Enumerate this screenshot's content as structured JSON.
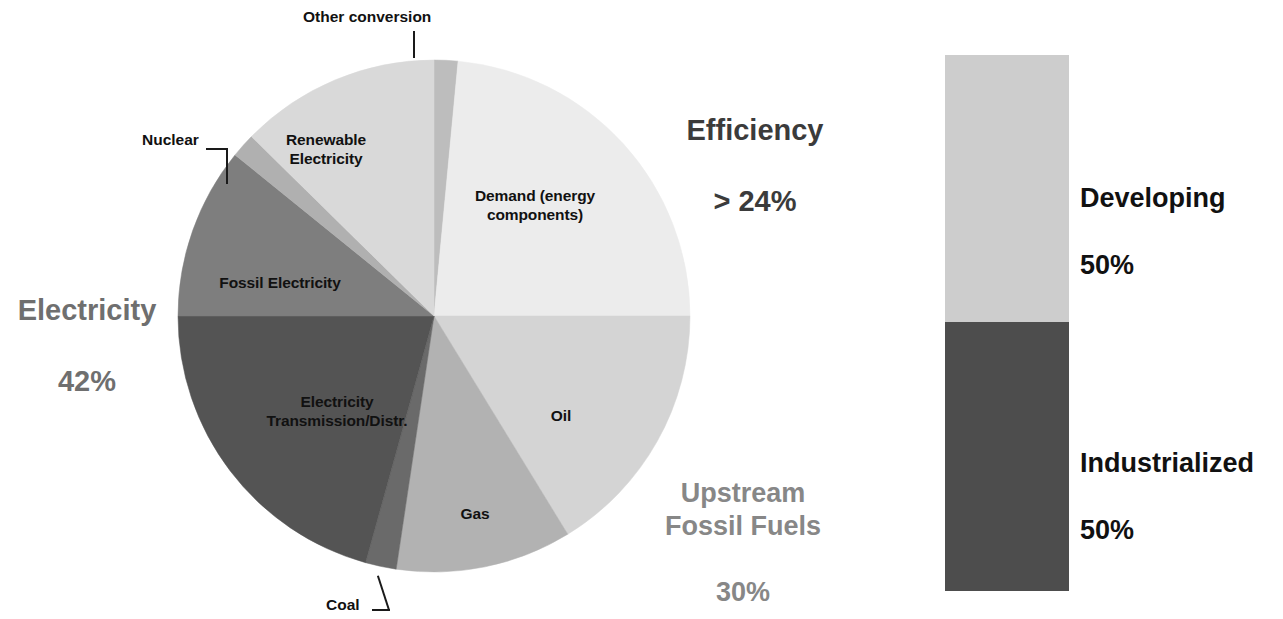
{
  "figure": {
    "background_color": "#ffffff"
  },
  "chart_data": [
    {
      "type": "pie",
      "title": "",
      "name": "global-energy-system-losses-pie",
      "total_note": "slices ordered clockwise starting at 12 o'clock",
      "categories": [
        "Other conversion",
        "Demand (energy components)",
        "Oil",
        "Gas",
        "Coal",
        "Electricity Transmission/Distr.",
        "Fossil Electricity",
        "Nuclear",
        "Renewable Electricity"
      ],
      "values": [
        1.5,
        24,
        16,
        11,
        2,
        21,
        11,
        1.5,
        12
      ],
      "unit": "%",
      "colors": [
        "#bdbdbd",
        "#ececec",
        "#d4d4d4",
        "#b2b2b2",
        "#6a6a6a",
        "#545454",
        "#7e7e7e",
        "#b0b0b0",
        "#d9d9d9"
      ],
      "slice_label_mode": "inside-and-callout",
      "inside_labels": [
        "Demand (energy\ncomponents)",
        "Oil",
        "Gas",
        "Electricity\nTransmission/Distr.",
        "Fossil Electricity",
        "Renewable\nElectricity"
      ],
      "callout_labels": [
        "Other conversion",
        "Nuclear",
        "Coal"
      ],
      "legend": "none",
      "grid": false
    },
    {
      "type": "bar",
      "name": "developing-vs-industrialized-stacked-bar",
      "orientation": "vertical-stacked",
      "title": "",
      "categories": [
        "Developing",
        "Industrialized"
      ],
      "values": [
        50,
        50
      ],
      "unit": "%",
      "colors": [
        "#cdcdcd",
        "#4d4d4d"
      ],
      "legend": "right-of-bar",
      "grid": false,
      "ylim": [
        0,
        100
      ]
    }
  ],
  "pie": {
    "center": {
      "x": 258,
      "y": 258
    },
    "radius": 256,
    "slices": [
      {
        "key": "other_conversion",
        "label": "Other conversion",
        "start_deg": 0,
        "end_deg": 5.4,
        "color": "#bdbdbd"
      },
      {
        "key": "demand",
        "label": "Demand (energy components)",
        "start_deg": 5.4,
        "end_deg": 90,
        "color": "#ececec"
      },
      {
        "key": "oil",
        "label": "Oil",
        "start_deg": 90,
        "end_deg": 148.5,
        "color": "#d4d4d4"
      },
      {
        "key": "gas",
        "label": "Gas",
        "start_deg": 148.5,
        "end_deg": 188.5,
        "color": "#b2b2b2"
      },
      {
        "key": "coal",
        "label": "Coal",
        "start_deg": 188.5,
        "end_deg": 195.5,
        "color": "#6a6a6a"
      },
      {
        "key": "electricity_td",
        "label": "Electricity Transmission/Distr.",
        "start_deg": 195.5,
        "end_deg": 270,
        "color": "#545454"
      },
      {
        "key": "fossil_elec",
        "label": "Fossil Electricity",
        "start_deg": 270,
        "end_deg": 309,
        "color": "#7e7e7e"
      },
      {
        "key": "nuclear",
        "label": "Nuclear",
        "start_deg": 309,
        "end_deg": 314.5,
        "color": "#b0b0b0"
      },
      {
        "key": "renewable_elec",
        "label": "Renewable Electricity",
        "start_deg": 314.5,
        "end_deg": 360,
        "color": "#d9d9d9"
      }
    ],
    "inside_labels": {
      "demand": "Demand (energy\ncomponents)",
      "oil": "Oil",
      "gas": "Gas",
      "electricity_td": "Electricity\nTransmission/Distr.",
      "fossil_elec": "Fossil Electricity",
      "renewable_elec": "Renewable\nElectricity"
    },
    "callouts": {
      "other_conversion": "Other conversion",
      "nuclear": "Nuclear",
      "coal": "Coal"
    }
  },
  "summary_labels": {
    "efficiency": {
      "title": "Efficiency",
      "value": "> 24%",
      "color": "#3b3b3b"
    },
    "electricity": {
      "title": "Electricity",
      "value": "42%",
      "color": "#6f6f6f"
    },
    "upstream_fossil": {
      "title": "Upstream\nFossil Fuels",
      "value": "30%",
      "color": "#878787"
    }
  },
  "bar_chart": {
    "segments": [
      {
        "key": "developing",
        "label": "Developing",
        "value": "50%",
        "color": "#cdcdcd"
      },
      {
        "key": "industrialized",
        "label": "Industrialized",
        "value": "50%",
        "color": "#4d4d4d"
      }
    ]
  }
}
